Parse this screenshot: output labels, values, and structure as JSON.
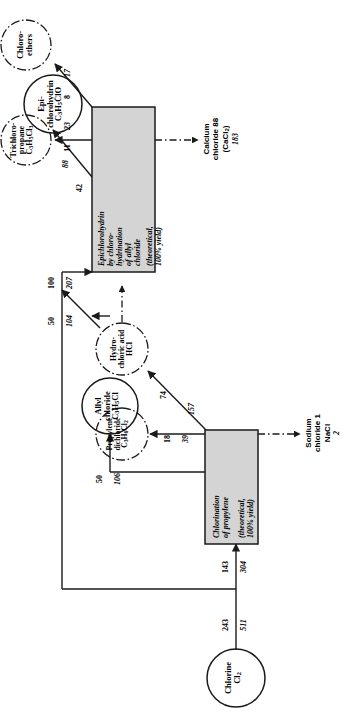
{
  "diagram": {
    "orientation": "rotated-90",
    "colors": {
      "line": "#1a1a1a",
      "box_fill": "#d4d4d4",
      "box_stroke": "#1a1a1a",
      "text": "#000000"
    }
  },
  "nodes": {
    "chlorine": {
      "name": "Chlorine",
      "formula_pre": "Cl",
      "formula_sub": "2",
      "shape": "circle-solid"
    },
    "allyl_chloride": {
      "line1": "Allyl",
      "line2": "chloride",
      "formula": "C3H5Cl",
      "shape": "circle-solid"
    },
    "epichlorohydrin": {
      "line1": "Epi-",
      "line2": "chlorohydrin",
      "formula": "C3H5ClO",
      "shape": "circle-solid"
    },
    "trichloropropane": {
      "line1": "Trichloro-",
      "line2": "propane",
      "formula": "C3H5Cl3",
      "shape": "circle-dashdot"
    },
    "chloroethers": {
      "line1": "Chloro-",
      "line2": "ethers",
      "shape": "circle-dashdot"
    },
    "propylene_dichloride": {
      "line1": "Propylene",
      "line2": "dichloride",
      "formula": "C3H6Cl2",
      "shape": "circle-dashdot"
    },
    "hydrochloric_acid": {
      "line1": "Hydro-",
      "line2": "chloric acid",
      "formula": "HCl",
      "shape": "circle-dashdot"
    }
  },
  "processes": {
    "chlorination": {
      "lines": [
        "Chlorination",
        "of propylene"
      ],
      "note": [
        "(theoretical,",
        "100% yield)"
      ],
      "shape": "box-shaded"
    },
    "epichlorohydrin_process": {
      "lines": [
        "Epichlorohydrin",
        "by chloro-",
        "hydrination",
        "of allyl",
        "chloride"
      ],
      "note": [
        "(theoretical,",
        "100% yield)"
      ],
      "shape": "box-shaded"
    }
  },
  "byproducts": {
    "calcium_chloride": {
      "line1": "Calcium",
      "line2_pre": "chloride ",
      "line2_value": "88",
      "line3_pre": "(CaCl",
      "line3_sub": "2",
      "line3_post": ")",
      "line4_value": "183"
    },
    "sodium_chloride": {
      "line1": "Sodium",
      "line2_pre": "chloride ",
      "line2_value": "1",
      "line3": "NaCl",
      "line4_value": "2"
    }
  },
  "flows": [
    {
      "id": "cl2-total",
      "plain": "243",
      "italic": "511",
      "from": "chlorine",
      "to": "split"
    },
    {
      "id": "cl2-to-chlorination",
      "plain": "143",
      "italic": "304",
      "from": "chlorine",
      "to": "chlorination"
    },
    {
      "id": "cl2-to-epichloro",
      "plain": "100",
      "italic": "207",
      "from": "chlorine",
      "to": "epichlorohydrin_process"
    },
    {
      "id": "allyl-to-epichloro",
      "plain": "50",
      "italic": "104",
      "from": "allyl_chloride",
      "to": "epichlorohydrin_process"
    },
    {
      "id": "chlorination-to-allyl",
      "plain": "50",
      "italic": "106",
      "from": "chlorination",
      "to": "allyl_chloride"
    },
    {
      "id": "to-propylene-dichl",
      "plain": "18",
      "italic": "39",
      "from": "chlorination",
      "to": "propylene_dichloride"
    },
    {
      "id": "to-hcl",
      "plain": "74",
      "italic": "157",
      "from": "chlorination",
      "to": "hydrochloric_acid"
    },
    {
      "id": "to-epichlorohydrin",
      "plain": "42",
      "italic": "88",
      "from": "epichlorohydrin_process",
      "to": "epichlorohydrin"
    },
    {
      "id": "to-trichloropropane",
      "plain": "11",
      "italic": "23",
      "from": "epichlorohydrin_process",
      "to": "trichloropropane"
    },
    {
      "id": "to-chloroethers",
      "plain": "8",
      "italic": "17",
      "from": "epichlorohydrin_process",
      "to": "chloroethers"
    }
  ]
}
